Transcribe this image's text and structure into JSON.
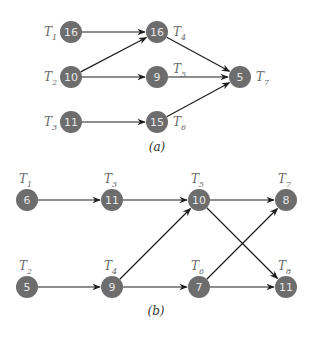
{
  "diagrams": [
    {
      "caption": "(a)",
      "label_placement": "side",
      "nodes": [
        {
          "id": "T1",
          "letter": "T",
          "sub": "1",
          "value": "16",
          "x": 71,
          "y": 32,
          "label_side": "left"
        },
        {
          "id": "T2",
          "letter": "T",
          "sub": "2",
          "value": "10",
          "x": 71,
          "y": 77,
          "label_side": "left"
        },
        {
          "id": "T3",
          "letter": "T",
          "sub": "3",
          "value": "11",
          "x": 71,
          "y": 122,
          "label_side": "left"
        },
        {
          "id": "T4",
          "letter": "T",
          "sub": "4",
          "value": "16",
          "x": 157,
          "y": 32,
          "label_side": "right"
        },
        {
          "id": "T5",
          "letter": "T",
          "sub": "5",
          "value": "9",
          "x": 157,
          "y": 77,
          "label_side": "above-right"
        },
        {
          "id": "T6",
          "letter": "T",
          "sub": "6",
          "value": "15",
          "x": 157,
          "y": 122,
          "label_side": "right"
        },
        {
          "id": "T7",
          "letter": "T",
          "sub": "7",
          "value": "5",
          "x": 240,
          "y": 77,
          "label_side": "right"
        }
      ],
      "edges": [
        [
          "T1",
          "T4"
        ],
        [
          "T2",
          "T4"
        ],
        [
          "T2",
          "T5"
        ],
        [
          "T3",
          "T6"
        ],
        [
          "T4",
          "T7"
        ],
        [
          "T5",
          "T7"
        ],
        [
          "T6",
          "T7"
        ]
      ],
      "caption_pos": {
        "x": 157,
        "y": 151
      }
    },
    {
      "caption": "(b)",
      "label_placement": "above",
      "nodes": [
        {
          "id": "T1",
          "letter": "T",
          "sub": "1",
          "value": "6",
          "x": 27,
          "y": 200
        },
        {
          "id": "T2",
          "letter": "T",
          "sub": "2",
          "value": "5",
          "x": 27,
          "y": 287
        },
        {
          "id": "T3",
          "letter": "T",
          "sub": "3",
          "value": "11",
          "x": 112,
          "y": 200
        },
        {
          "id": "T4",
          "letter": "T",
          "sub": "4",
          "value": "9",
          "x": 112,
          "y": 287
        },
        {
          "id": "T5",
          "letter": "T",
          "sub": "5",
          "value": "10",
          "x": 199,
          "y": 200
        },
        {
          "id": "T6",
          "letter": "T",
          "sub": "6",
          "value": "7",
          "x": 199,
          "y": 287
        },
        {
          "id": "T7",
          "letter": "T",
          "sub": "7",
          "value": "8",
          "x": 286,
          "y": 200
        },
        {
          "id": "T8",
          "letter": "T",
          "sub": "8",
          "value": "11",
          "x": 286,
          "y": 287
        }
      ],
      "edges": [
        [
          "T1",
          "T3"
        ],
        [
          "T3",
          "T5"
        ],
        [
          "T2",
          "T4"
        ],
        [
          "T4",
          "T5"
        ],
        [
          "T4",
          "T6"
        ],
        [
          "T5",
          "T7"
        ],
        [
          "T5",
          "T8"
        ],
        [
          "T6",
          "T7"
        ],
        [
          "T6",
          "T8"
        ]
      ],
      "caption_pos": {
        "x": 156,
        "y": 315
      }
    }
  ],
  "style": {
    "node_fill": "#6d6d6d",
    "node_text": "#e6e6e6",
    "edge_color": "#1e1e1e",
    "node_radius": 11
  }
}
